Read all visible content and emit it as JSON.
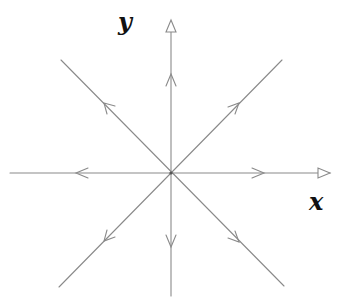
{
  "diagram": {
    "type": "phase-portrait",
    "axes": {
      "x_label": "x",
      "y_label": "y"
    },
    "origin": {
      "x": 171,
      "y": 173
    },
    "colors": {
      "line": "#8a8a8a",
      "axis_arrow": "#8a8a8a",
      "label": "#111111",
      "background": "#ffffff"
    },
    "trajectories": [
      {
        "name": "positive-x",
        "direction": "outward",
        "angle_deg": 0
      },
      {
        "name": "negative-x",
        "direction": "outward",
        "angle_deg": 180
      },
      {
        "name": "positive-y",
        "direction": "outward",
        "angle_deg": 90
      },
      {
        "name": "negative-y",
        "direction": "outward",
        "angle_deg": 270
      },
      {
        "name": "upper-right-diagonal",
        "direction": "outward",
        "angle_deg": 45
      },
      {
        "name": "upper-left-diagonal",
        "direction": "outward",
        "angle_deg": 135
      },
      {
        "name": "lower-left-diagonal",
        "direction": "outward",
        "angle_deg": 225
      },
      {
        "name": "lower-right-diagonal",
        "direction": "outward",
        "angle_deg": 315
      }
    ]
  }
}
